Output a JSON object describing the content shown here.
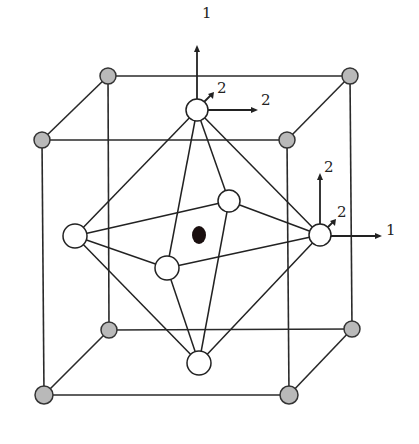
{
  "diagram": {
    "colors": {
      "corner_atom": "#b9b9b9",
      "octahedral_atom": "#ffffff",
      "center_atom": "#1a0f0f",
      "lines": "#222222"
    },
    "labels": {
      "top_vertical": "1",
      "top_diagonal": "2",
      "top_horizontal": "2",
      "right_vertical": "2",
      "right_diagonal": "2",
      "right_horizontal": "1"
    }
  }
}
